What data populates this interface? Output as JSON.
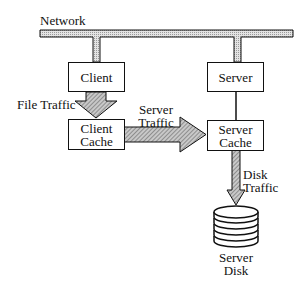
{
  "diagram": {
    "network_label": "Network",
    "nodes": {
      "client": "Client",
      "server": "Server",
      "client_cache_line1": "Client",
      "client_cache_line2": "Cache",
      "server_cache_line1": "Server",
      "server_cache_line2": "Cache",
      "server_disk_line1": "Server",
      "server_disk_line2": "Disk"
    },
    "edges": {
      "file_traffic": "File Traffic",
      "server_traffic_line1": "Server",
      "server_traffic_line2": "Traffic",
      "disk_traffic_line1": "Disk",
      "disk_traffic_line2": "Traffic"
    },
    "colors": {
      "stroke": "#111111",
      "hatch_light": "#bdbdbd",
      "hatch_dark": "#555555"
    }
  }
}
